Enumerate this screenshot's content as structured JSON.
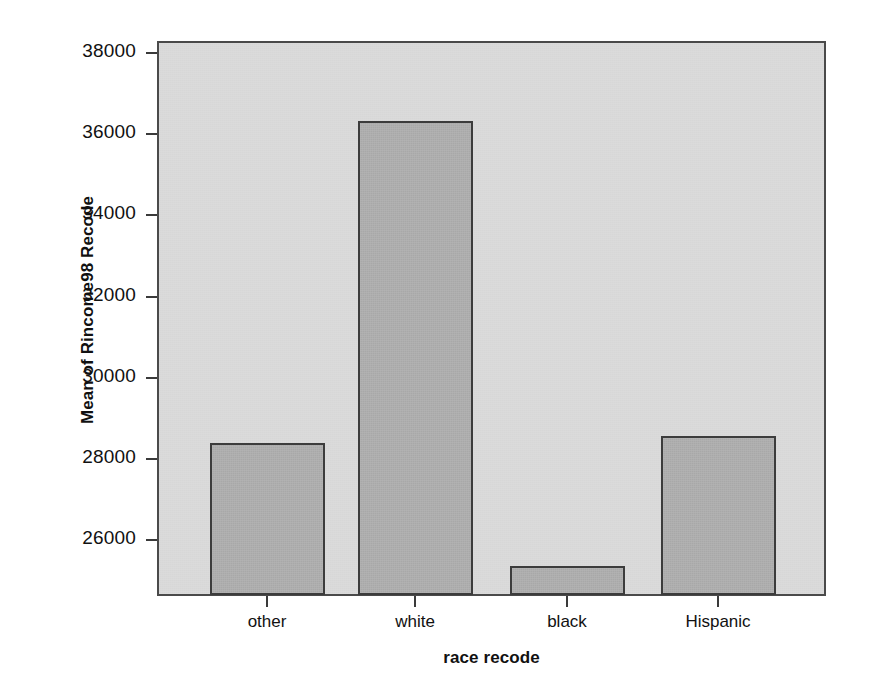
{
  "chart_data": {
    "type": "bar",
    "title": "",
    "xlabel": "race recode",
    "ylabel": "Mean of Rincome98 Recode",
    "categories": [
      "other",
      "white",
      "black",
      "Hispanic"
    ],
    "values": [
      28400,
      36330,
      25370,
      28570
    ],
    "series": [
      {
        "name": "Mean of Rincome98 Recode",
        "values": [
          28400,
          36330,
          25370,
          28570
        ]
      }
    ],
    "ylim": [
      24620,
      38300
    ],
    "y_ticks": [
      26000,
      28000,
      30000,
      32000,
      34000,
      36000,
      38000
    ],
    "y_tick_labels": [
      "26000",
      "28000",
      "30000",
      "32000",
      "34000",
      "36000",
      "38000"
    ],
    "x_tick_labels": [
      "other",
      "white",
      "black",
      "Hispanic"
    ],
    "grid": false,
    "legend": "none",
    "colors": {
      "plot_background": "#d7d7d7",
      "bar_fill": "#a8a8a8",
      "bar_border": "#3c3c3c",
      "frame": "#4a4a4a",
      "text": "#111111",
      "page_background": "#ffffff"
    }
  }
}
